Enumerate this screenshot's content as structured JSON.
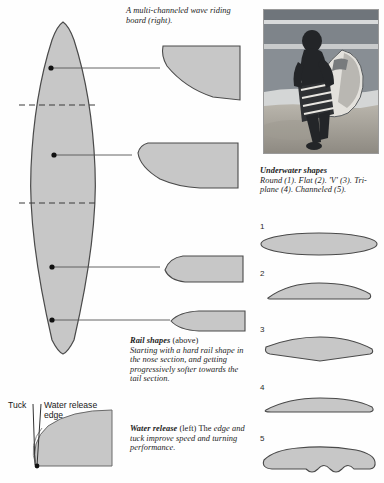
{
  "figure": {
    "title_caption": "A multi-channeled wave riding board (right).",
    "board_outline_name": "surfboard-plan-outline"
  },
  "photo": {
    "alt": "surfer-carrying-striped-board-photo",
    "caption_subject": "surfer walking on beach carrying channeled surfboard"
  },
  "underwater": {
    "heading": "Underwater shapes",
    "body": "Round (1). Flat (2). 'V' (3). Tri-plane (4). Channeled (5).",
    "shapes": [
      {
        "num": "1",
        "name": "round",
        "label": "Round"
      },
      {
        "num": "2",
        "name": "flat",
        "label": "Flat"
      },
      {
        "num": "3",
        "name": "vee",
        "label": "'V'"
      },
      {
        "num": "4",
        "name": "tri-plane",
        "label": "Tri-plane"
      },
      {
        "num": "5",
        "name": "channeled",
        "label": "Channeled"
      }
    ]
  },
  "rail": {
    "heading": "Rail shapes",
    "qualifier": "(above)",
    "body": "Starting with a hard rail shape in the nose section, and getting progressively softer towards the tail section.",
    "sections": [
      "nose-rail",
      "mid-rail",
      "tail-rail-upper",
      "tail-rail-lower"
    ]
  },
  "water_release": {
    "heading": "Water release",
    "qualifier": "(left) The",
    "body": "edge and tuck improve speed and turning performance.",
    "labels": {
      "tuck": "Tuck",
      "edge_line1": "Water release",
      "edge_line2": "edge"
    }
  },
  "colors": {
    "fill": "#c7c7c7",
    "fill_light": "#d2d2d2",
    "stroke": "#4a4a4a",
    "leader": "#555555",
    "text": "#1a1a1a",
    "background": "#fefefe"
  }
}
